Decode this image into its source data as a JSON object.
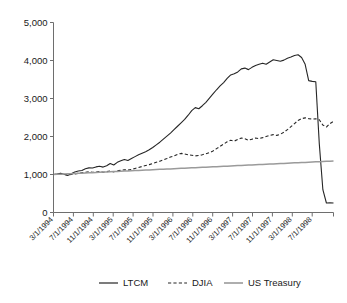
{
  "chart_data": {
    "type": "line",
    "title": "",
    "subtitle": "",
    "xlabel": "",
    "ylabel": "",
    "ylim": [
      0,
      5000
    ],
    "grid": false,
    "legend_position": "bottom",
    "y_ticks": [
      "0",
      "1,000",
      "2,000",
      "3,000",
      "4,000",
      "5,000"
    ],
    "y_tick_values": [
      0,
      1000,
      2000,
      3000,
      4000,
      5000
    ],
    "x_tick_labels": [
      "3/1/1994",
      "7/1/1994",
      "11/1/1994",
      "3/1/1995",
      "7/1/1995",
      "11/1/1995",
      "3/1/1996",
      "7/1/1996",
      "11/1/1996",
      "3/1/1997",
      "7/1/1997",
      "11/1/1997",
      "3/1/1998",
      "7/1/1998"
    ],
    "series": [
      {
        "name": "LTCM",
        "color": "#262626",
        "style": "solid",
        "values": [
          1000,
          1010,
          1035,
          1005,
          975,
          1020,
          1065,
          1090,
          1105,
          1150,
          1175,
          1170,
          1200,
          1215,
          1195,
          1230,
          1290,
          1250,
          1320,
          1360,
          1395,
          1370,
          1420,
          1470,
          1520,
          1560,
          1600,
          1650,
          1710,
          1780,
          1850,
          1930,
          2010,
          2090,
          2180,
          2270,
          2360,
          2450,
          2560,
          2680,
          2760,
          2730,
          2810,
          2900,
          3010,
          3120,
          3230,
          3330,
          3420,
          3530,
          3620,
          3650,
          3700,
          3780,
          3800,
          3760,
          3820,
          3870,
          3900,
          3930,
          3900,
          3960,
          4020,
          4000,
          3980,
          4010,
          4060,
          4090,
          4130,
          4150,
          4080,
          3900,
          3470,
          3450,
          3440,
          1800,
          600,
          250,
          255,
          250
        ]
      },
      {
        "name": "DJIA",
        "color": "#262626",
        "style": "dashed",
        "values": [
          1000,
          1005,
          1020,
          1000,
          985,
          1000,
          1015,
          1030,
          1045,
          1060,
          1070,
          1055,
          1065,
          1080,
          1060,
          1075,
          1090,
          1070,
          1095,
          1110,
          1125,
          1115,
          1135,
          1160,
          1185,
          1210,
          1235,
          1260,
          1290,
          1320,
          1350,
          1385,
          1420,
          1460,
          1490,
          1530,
          1555,
          1540,
          1520,
          1505,
          1490,
          1500,
          1520,
          1545,
          1575,
          1620,
          1680,
          1740,
          1800,
          1860,
          1900,
          1880,
          1920,
          1960,
          1940,
          1900,
          1930,
          1960,
          1945,
          1970,
          2000,
          2030,
          2050,
          2030,
          2060,
          2110,
          2180,
          2260,
          2340,
          2420,
          2470,
          2490,
          2470,
          2455,
          2465,
          2440,
          2300,
          2250,
          2340,
          2400
        ]
      },
      {
        "name": "US Treasury",
        "color": "#9a9a9a",
        "style": "solid",
        "values": [
          1000,
          1004,
          1009,
          1013,
          1018,
          1022,
          1027,
          1031,
          1036,
          1040,
          1045,
          1049,
          1054,
          1058,
          1063,
          1067,
          1072,
          1076,
          1081,
          1085,
          1090,
          1094,
          1099,
          1103,
          1108,
          1112,
          1117,
          1121,
          1126,
          1130,
          1135,
          1139,
          1144,
          1148,
          1153,
          1157,
          1162,
          1166,
          1171,
          1175,
          1180,
          1184,
          1189,
          1193,
          1198,
          1202,
          1207,
          1211,
          1216,
          1220,
          1225,
          1229,
          1234,
          1238,
          1243,
          1247,
          1252,
          1256,
          1261,
          1265,
          1270,
          1274,
          1279,
          1283,
          1288,
          1292,
          1297,
          1301,
          1306,
          1310,
          1315,
          1319,
          1324,
          1328,
          1333,
          1337,
          1342,
          1346,
          1351,
          1355
        ]
      }
    ]
  },
  "legend": {
    "items": [
      {
        "label": "LTCM",
        "color": "#262626",
        "style": "solid"
      },
      {
        "label": "DJIA",
        "color": "#262626",
        "style": "dashed"
      },
      {
        "label": "US Treasury",
        "color": "#9a9a9a",
        "style": "solid"
      }
    ]
  }
}
